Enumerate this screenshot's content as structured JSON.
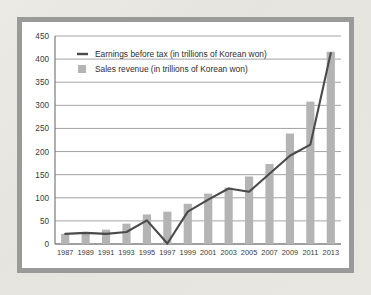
{
  "chart_data": {
    "type": "bar",
    "title": "",
    "xlabel": "",
    "ylabel": "",
    "ylim": [
      0,
      450
    ],
    "ytick_step": 50,
    "yticks": [
      0,
      50,
      100,
      150,
      200,
      250,
      300,
      350,
      400,
      450
    ],
    "grid": true,
    "legend_position": "top-left-inside",
    "categories": [
      "1987",
      "1989",
      "1991",
      "1993",
      "1995",
      "1997",
      "1999",
      "2001",
      "2003",
      "2005",
      "2007",
      "2009",
      "2011",
      "2013"
    ],
    "series": [
      {
        "name": "Sales revenue (in trillions of Korean won)",
        "type": "bar",
        "color": "#b4b4b4",
        "values": [
          22,
          26,
          31,
          44,
          64,
          70,
          87,
          109,
          122,
          146,
          173,
          239,
          308,
          416
        ]
      },
      {
        "name": "Earnings before tax (in trillions of Korean won)",
        "type": "line",
        "color": "#4a4a4a",
        "values": [
          22,
          24,
          22,
          26,
          51,
          1,
          70,
          96,
          120,
          113,
          152,
          191,
          215,
          413
        ]
      }
    ]
  },
  "legend": {
    "items": [
      {
        "label": "Earnings before tax (in trillions of Korean won)",
        "marker": "line",
        "color": "#4a4a4a"
      },
      {
        "label": "Sales revenue (in trillions of Korean won)",
        "marker": "square",
        "color": "#b4b4b4"
      }
    ]
  },
  "colors": {
    "bar": "#b4b4b4",
    "line": "#4a4a4a",
    "grid": "#8c8c8c",
    "frame": "#9a9a9a",
    "plot_background": "#ffffff",
    "page_background": "#e8e6e0"
  }
}
